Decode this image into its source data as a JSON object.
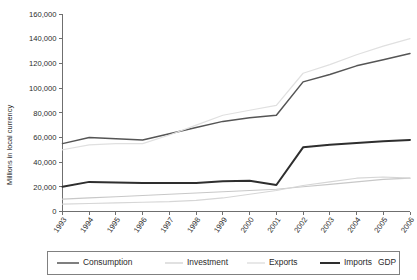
{
  "chart_data": {
    "type": "line",
    "title": "",
    "xlabel": "",
    "ylabel": "Millions in local currency",
    "ylim": [
      0,
      160000
    ],
    "ytick_step": 20000,
    "grid": false,
    "legend_position": "bottom",
    "categories": [
      "1993",
      "1994",
      "1995",
      "1996",
      "1997",
      "1998",
      "1999",
      "2000",
      "2001",
      "2002",
      "2003",
      "2004",
      "2005",
      "2006"
    ],
    "series": [
      {
        "name": "Consumption",
        "color": "#555555",
        "width": 1.5,
        "values": [
          55000,
          60000,
          59000,
          58000,
          63000,
          68000,
          73000,
          76000,
          78000,
          105000,
          111000,
          118000,
          123000,
          128000
        ]
      },
      {
        "name": "Investment",
        "color": "#c8c8c8",
        "width": 1.1,
        "values": [
          10000,
          11000,
          12000,
          13000,
          14000,
          15000,
          16000,
          17000,
          18000,
          20000,
          22000,
          24000,
          26000,
          27000
        ]
      },
      {
        "name": "Exports",
        "color": "#d6d6d6",
        "width": 1.1,
        "values": [
          6000,
          6500,
          7000,
          7500,
          8000,
          9000,
          11000,
          14000,
          17000,
          21000,
          24000,
          27000,
          28000,
          27000
        ]
      },
      {
        "name": "Imports",
        "color": "#2e2e2e",
        "width": 2.0,
        "values": [
          20000,
          24000,
          23500,
          23000,
          23000,
          23000,
          24500,
          25000,
          21500,
          52000,
          54000,
          55500,
          57000,
          58000
        ]
      },
      {
        "name": "GDP",
        "color": "#e0e0e0",
        "width": 1.2,
        "values": [
          50000,
          54000,
          55000,
          55000,
          62000,
          70000,
          78000,
          82000,
          86000,
          112000,
          119000,
          127000,
          134000,
          140000
        ]
      }
    ],
    "ytick_labels": [
      "0",
      "20,000",
      "40,000",
      "60,000",
      "80,000",
      "100,000",
      "120,000",
      "140,000",
      "160,000"
    ],
    "ytick_values": [
      0,
      20000,
      40000,
      60000,
      80000,
      100000,
      120000,
      140000,
      160000
    ]
  },
  "legend": {
    "items": [
      {
        "label": "Consumption"
      },
      {
        "label": "Investment"
      },
      {
        "label": "Exports"
      },
      {
        "label": "Imports"
      },
      {
        "label": "GDP"
      }
    ]
  }
}
